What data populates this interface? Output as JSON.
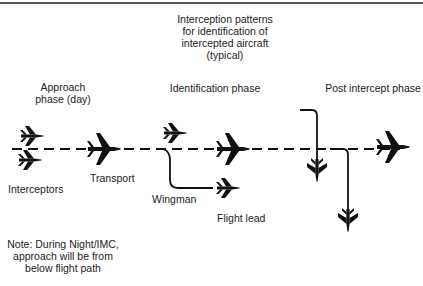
{
  "diagram": {
    "title_lines": [
      "Interception patterns",
      "for identification of",
      "intercepted aircraft",
      "(typical)"
    ],
    "phases": {
      "approach": [
        "Approach",
        "phase (day)"
      ],
      "identification": "Identification phase",
      "post_intercept": "Post intercept phase"
    },
    "labels": {
      "interceptors": "Interceptors",
      "transport": "Transport",
      "wingman": "Wingman",
      "flight_lead": "Flight lead"
    },
    "note_lines": [
      "Note: During Night/IMC,",
      "approach will be from",
      "below flight path"
    ],
    "colors": {
      "ink": "#111111",
      "background": "#ffffff",
      "border": "#555555"
    }
  }
}
